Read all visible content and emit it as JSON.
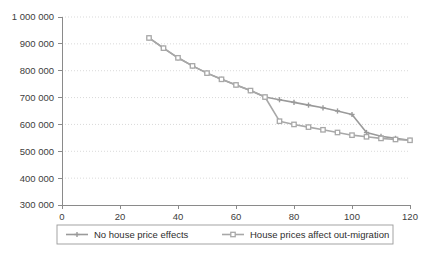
{
  "chart_data": {
    "type": "line",
    "title": "",
    "xlabel": "",
    "ylabel": "",
    "xlim": [
      0,
      120
    ],
    "ylim": [
      300000,
      1000000
    ],
    "grid": true,
    "legend_position": "bottom",
    "x_ticks": [
      0,
      20,
      40,
      60,
      80,
      100,
      120
    ],
    "x_tick_labels": [
      "0",
      "20",
      "40",
      "60",
      "80",
      "100",
      "120"
    ],
    "y_ticks": [
      300000,
      400000,
      500000,
      600000,
      700000,
      800000,
      900000,
      1000000
    ],
    "y_tick_labels": [
      "300 000",
      "400 000",
      "500 000",
      "600 000",
      "700 000",
      "800 000",
      "900 000",
      "1 000 000"
    ],
    "x": [
      30,
      35,
      40,
      45,
      50,
      55,
      60,
      65,
      70,
      75,
      80,
      85,
      90,
      95,
      100,
      105,
      110,
      115,
      120
    ],
    "series": [
      {
        "name": "No house price effects",
        "color": "#9a9a9a",
        "marker": "plus",
        "values": [
          922000,
          884000,
          848000,
          818000,
          791000,
          768000,
          747000,
          726000,
          702000,
          692000,
          682000,
          672000,
          662000,
          650000,
          637000,
          570000,
          556000,
          548000,
          541000
        ]
      },
      {
        "name": "House prices affect out-migration",
        "color": "#a8a8a8",
        "marker": "square",
        "values": [
          922000,
          884000,
          848000,
          818000,
          791000,
          768000,
          747000,
          726000,
          702000,
          612000,
          600000,
          590000,
          580000,
          570000,
          560000,
          554000,
          548000,
          544000,
          541000
        ]
      }
    ]
  },
  "legend": {
    "items": [
      {
        "label": "No house price effects"
      },
      {
        "label": "House prices affect out-migration"
      }
    ]
  },
  "colors": {
    "series_1": "#9a9a9a",
    "series_2": "#a8a8a8",
    "axis": "#8a8a8a",
    "grid": "#cfcfcf",
    "text": "#3a3a3a",
    "background": "#ffffff"
  }
}
